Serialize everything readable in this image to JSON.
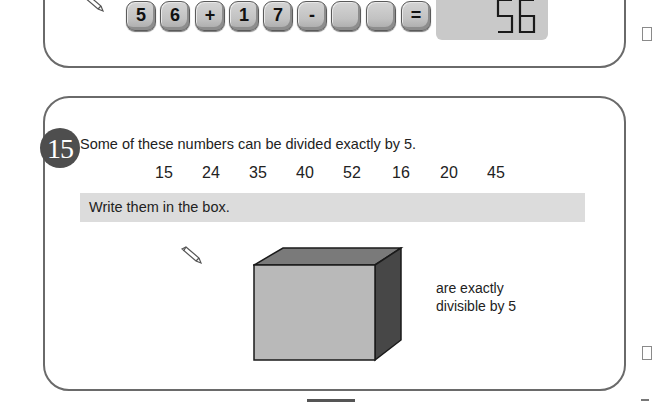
{
  "previous_question": {
    "keys": [
      "5",
      "6",
      "+",
      "1",
      "7",
      "-",
      "",
      "",
      "="
    ],
    "display_value": "56"
  },
  "question": {
    "number": "15",
    "prompt": "Some of these numbers can be divided exactly by 5.",
    "numbers": [
      "15",
      "24",
      "35",
      "40",
      "52",
      "16",
      "20",
      "45"
    ],
    "instruction": "Write them in the box.",
    "answer_box_value": "",
    "caption_line1": "are exactly",
    "caption_line2": "divisible by 5"
  },
  "icons": {
    "pencil": "pencil-icon",
    "answer_box": "cube-answer-box"
  },
  "colors": {
    "panel_border": "#6a6a6a",
    "badge": "#4e4e4e",
    "instruction_bar": "#dcdcdc",
    "cube_front": "#b9b9b9",
    "cube_top": "#7a7a7a",
    "cube_side": "#474747",
    "display": "#c9c9c9"
  }
}
